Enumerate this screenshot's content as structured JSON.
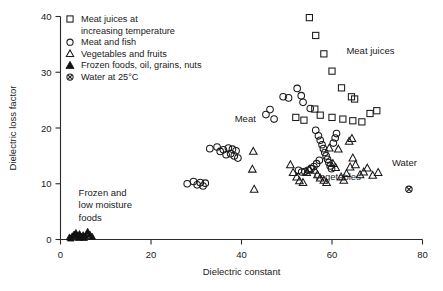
{
  "chart_data": {
    "type": "scatter",
    "title": "",
    "xlabel": "Dielectric constant",
    "ylabel": "Dielectric loss factor",
    "xlim": [
      0,
      80
    ],
    "ylim": [
      0,
      40
    ],
    "xticks": [
      0,
      20,
      40,
      60,
      80
    ],
    "yticks": [
      0,
      10,
      20,
      30,
      40
    ],
    "grid": false,
    "legend_position": "top-left-inside",
    "legend": [
      {
        "marker": "open-square",
        "label_line1": "Meat juices at",
        "label_line2": "increasing temperature"
      },
      {
        "marker": "open-circle",
        "label_line1": "Meat and fish",
        "label_line2": ""
      },
      {
        "marker": "open-triangle",
        "label_line1": "Vegetables and fruits",
        "label_line2": ""
      },
      {
        "marker": "filled-triangle",
        "label_line1": "Frozen foods, oil, grains, nuts",
        "label_line2": ""
      },
      {
        "marker": "circled-cross",
        "label_line1": "Water at 25°C",
        "label_line2": ""
      }
    ],
    "annotations": [
      {
        "text": "Meat",
        "x": 38.5,
        "y": 21.0
      },
      {
        "text": "Meat juices",
        "x": 68.5,
        "y": 33.2
      },
      {
        "text": "Vegetables",
        "x": 56.0,
        "y": 10.6
      },
      {
        "text": "Water",
        "x": 76.0,
        "y": 13.2
      },
      {
        "text": "Frozen and",
        "x": 4.0,
        "y": 7.8
      },
      {
        "text": "low moisture",
        "x": 4.0,
        "y": 5.6
      },
      {
        "text": "foods",
        "x": 4.0,
        "y": 3.4
      }
    ],
    "series": [
      {
        "name": "Meat juices at increasing temperature",
        "marker": "open-square",
        "points": [
          [
            55.0,
            39.8
          ],
          [
            56.4,
            36.6
          ],
          [
            58.2,
            33.3
          ],
          [
            60.0,
            30.2
          ],
          [
            62.1,
            27.2
          ],
          [
            64.3,
            25.6
          ],
          [
            65.0,
            25.2
          ],
          [
            56.2,
            23.4
          ],
          [
            57.4,
            22.3
          ],
          [
            60.0,
            21.9
          ],
          [
            62.4,
            21.6
          ],
          [
            64.6,
            21.3
          ],
          [
            66.6,
            21.1
          ],
          [
            68.4,
            22.6
          ],
          [
            69.9,
            23.1
          ],
          [
            53.8,
            21.4
          ],
          [
            52.0,
            21.9
          ]
        ]
      },
      {
        "name": "Meat and fish",
        "marker": "open-circle",
        "points": [
          [
            33.0,
            16.3
          ],
          [
            34.6,
            16.6
          ],
          [
            35.3,
            15.8
          ],
          [
            36.0,
            16.1
          ],
          [
            36.6,
            15.2
          ],
          [
            37.1,
            16.4
          ],
          [
            37.6,
            15.4
          ],
          [
            38.0,
            16.2
          ],
          [
            38.4,
            15.0
          ],
          [
            38.8,
            15.9
          ],
          [
            39.2,
            14.6
          ],
          [
            28.0,
            10.0
          ],
          [
            29.4,
            10.4
          ],
          [
            30.2,
            9.8
          ],
          [
            30.9,
            10.2
          ],
          [
            31.5,
            9.6
          ],
          [
            32.0,
            10.1
          ],
          [
            45.4,
            22.4
          ],
          [
            46.3,
            23.3
          ],
          [
            47.2,
            21.6
          ],
          [
            49.2,
            25.6
          ],
          [
            50.4,
            25.4
          ],
          [
            52.3,
            27.1
          ],
          [
            53.2,
            25.8
          ],
          [
            53.6,
            24.6
          ],
          [
            55.2,
            23.5
          ],
          [
            56.4,
            19.6
          ],
          [
            57.0,
            18.6
          ],
          [
            57.4,
            17.8
          ],
          [
            57.8,
            17.0
          ],
          [
            58.1,
            16.3
          ],
          [
            58.4,
            15.6
          ],
          [
            58.7,
            15.0
          ],
          [
            59.0,
            14.4
          ],
          [
            59.3,
            13.8
          ],
          [
            59.6,
            13.2
          ],
          [
            59.9,
            12.7
          ],
          [
            57.2,
            14.2
          ],
          [
            56.6,
            13.6
          ],
          [
            56.0,
            13.1
          ],
          [
            55.4,
            12.7
          ],
          [
            54.7,
            12.4
          ],
          [
            54.0,
            12.2
          ],
          [
            53.3,
            12.1
          ],
          [
            52.6,
            12.4
          ],
          [
            60.3,
            17.3
          ],
          [
            60.7,
            18.2
          ],
          [
            61.0,
            19.0
          ]
        ]
      },
      {
        "name": "Vegetables and fruits",
        "marker": "open-triangle",
        "points": [
          [
            42.6,
            15.8
          ],
          [
            42.4,
            12.6
          ],
          [
            42.8,
            9.0
          ],
          [
            52.2,
            11.2
          ],
          [
            52.8,
            10.5
          ],
          [
            53.6,
            10.2
          ],
          [
            54.4,
            12.0
          ],
          [
            55.0,
            12.6
          ],
          [
            56.2,
            12.4
          ],
          [
            56.8,
            11.6
          ],
          [
            57.4,
            11.0
          ],
          [
            58.2,
            10.6
          ],
          [
            58.8,
            10.2
          ],
          [
            60.2,
            13.6
          ],
          [
            60.8,
            12.9
          ],
          [
            62.0,
            11.2
          ],
          [
            62.6,
            10.6
          ],
          [
            63.2,
            11.8
          ],
          [
            64.0,
            13.0
          ],
          [
            64.6,
            14.6
          ],
          [
            65.2,
            13.4
          ],
          [
            66.2,
            11.6
          ],
          [
            67.0,
            12.1
          ],
          [
            67.8,
            12.8
          ],
          [
            69.0,
            11.5
          ],
          [
            70.2,
            12.0
          ],
          [
            63.8,
            17.6
          ],
          [
            64.4,
            18.1
          ],
          [
            61.4,
            16.2
          ],
          [
            59.4,
            16.4
          ],
          [
            50.8,
            13.4
          ],
          [
            51.4,
            12.0
          ]
        ]
      },
      {
        "name": "Frozen foods, oil, grains, nuts",
        "marker": "filled-triangle",
        "points": [
          [
            2.0,
            0.4
          ],
          [
            2.6,
            0.6
          ],
          [
            3.0,
            0.9
          ],
          [
            3.4,
            1.2
          ],
          [
            3.8,
            0.7
          ],
          [
            4.2,
            1.0
          ],
          [
            4.6,
            0.5
          ],
          [
            5.0,
            0.8
          ],
          [
            5.5,
            0.6
          ],
          [
            6.0,
            1.4
          ],
          [
            6.5,
            0.9
          ],
          [
            7.0,
            0.5
          ],
          [
            2.3,
            0.2
          ],
          [
            4.0,
            0.3
          ],
          [
            5.2,
            0.3
          ]
        ]
      },
      {
        "name": "Water at 25°C",
        "marker": "circled-cross",
        "points": [
          [
            77.0,
            9.0
          ]
        ]
      }
    ]
  }
}
